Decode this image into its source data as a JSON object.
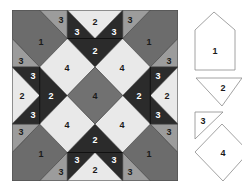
{
  "colors": {
    "background": "#ffffff",
    "piece1_corner": "#6c6c6c",
    "piece3_corner_triangle": "#9c9c9c",
    "dark": "#2b2b2b",
    "light": "#e9e9e9",
    "center_diamond": "#717171",
    "outline": "#3a3a3a",
    "label_on_light": "#1a1a1a",
    "label_on_dark": "#ffffff",
    "key_outline": "#8a8a8a"
  },
  "block": {
    "labels": {
      "corner_piece": "1",
      "strip_triangle": "2",
      "small_triangle": "3",
      "diamond": "4"
    }
  },
  "key": {
    "pieces": [
      {
        "shape": "house-pentagon",
        "label": "1"
      },
      {
        "shape": "large-triangle",
        "label": "2"
      },
      {
        "shape": "small-right-triangle",
        "label": "3"
      },
      {
        "shape": "square-diamond",
        "label": "4"
      }
    ]
  }
}
